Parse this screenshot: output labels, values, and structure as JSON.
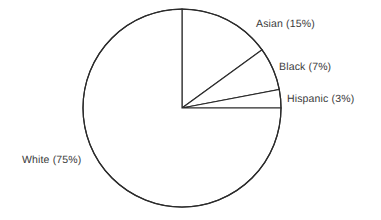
{
  "chart_data": {
    "type": "pie",
    "title": "",
    "subtitle": "",
    "xlabel": "",
    "ylabel": "",
    "legend_position": "none",
    "grid": false,
    "start_angle_deg": 0,
    "direction": "clockwise",
    "categories": [
      "Asian",
      "Black",
      "Hispanic",
      "White"
    ],
    "values": [
      15,
      7,
      3,
      75
    ],
    "units": "percent",
    "total": 100,
    "slices": [
      {
        "name": "Asian",
        "value": 15,
        "label": "Asian (15%)",
        "angle_deg": 54,
        "start_deg": 0,
        "end_deg": 54,
        "fill": "#ffffff",
        "stroke": "#2b2b2b"
      },
      {
        "name": "Black",
        "value": 7,
        "label": "Black (7%)",
        "angle_deg": 25.2,
        "start_deg": 54,
        "end_deg": 79.2,
        "fill": "#ffffff",
        "stroke": "#2b2b2b"
      },
      {
        "name": "Hispanic",
        "value": 3,
        "label": "Hispanic (3%)",
        "angle_deg": 10.8,
        "start_deg": 79.2,
        "end_deg": 90,
        "fill": "#ffffff",
        "stroke": "#2b2b2b"
      },
      {
        "name": "White",
        "value": 75,
        "label": "White (75%)",
        "angle_deg": 270,
        "start_deg": 90,
        "end_deg": 360,
        "fill": "#ffffff",
        "stroke": "#2b2b2b"
      }
    ],
    "geometry": {
      "center_x": 182,
      "center_y": 108,
      "radius": 99
    },
    "colors": {
      "background": "#ffffff",
      "outline": "#2b2b2b",
      "text": "#3a3a3a"
    }
  }
}
